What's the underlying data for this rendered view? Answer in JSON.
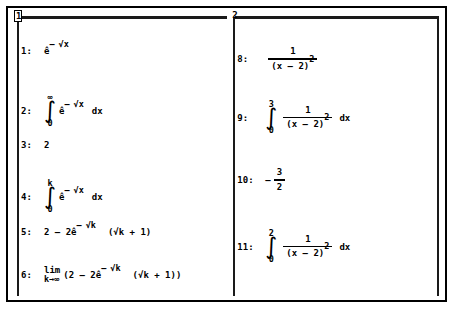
{
  "window": {
    "title": "Algebra Window",
    "pane_divider": "vertical"
  },
  "panes": [
    {
      "badge": "1",
      "name": "pane-one",
      "rows": [
        {
          "label": "1:",
          "kind": "power",
          "base": "ê",
          "exponent_sign": "–",
          "exponent": "√x"
        },
        {
          "label": "2:",
          "kind": "integral",
          "lower": "0",
          "upper": "∞",
          "base": "ê",
          "exponent_sign": "–",
          "exponent": "√x",
          "differential": "dx"
        },
        {
          "label": "3:",
          "kind": "plain",
          "text": "2"
        },
        {
          "label": "4:",
          "kind": "integral",
          "lower": "0",
          "upper": "k",
          "base": "ê",
          "exponent_sign": "–",
          "exponent": "√x",
          "differential": "dx"
        },
        {
          "label": "5:",
          "kind": "expr5",
          "prefix": "2  –  2 ",
          "base": "ê",
          "exponent_sign": "–",
          "exponent": "√k",
          "suffix": "(√k  +  1)"
        },
        {
          "label": "6:",
          "kind": "limit",
          "lim_main": "lim",
          "lim_sub": "k→∞",
          "prefix": "(2  –  2 ",
          "base": "ê",
          "exponent_sign": "–",
          "exponent": "√k",
          "suffix": "(√k  +  1))"
        },
        {
          "label": "7:",
          "kind": "cursor",
          "cursor_char": "2"
        }
      ]
    },
    {
      "badge": "2",
      "name": "pane-two",
      "rows": [
        {
          "label": "8:",
          "kind": "fraction",
          "numerator": "1",
          "denominator_base": "(x  –  2)",
          "denominator_exp": "2"
        },
        {
          "label": "9:",
          "kind": "int-frac",
          "lower": "0",
          "upper": "3",
          "numerator": "1",
          "denominator_base": "(x  –  2)",
          "denominator_exp": "2",
          "differential": "dx"
        },
        {
          "label": "10:",
          "kind": "neg-frac",
          "sign": "–",
          "numerator": "3",
          "denominator": "2"
        },
        {
          "label": "11:",
          "kind": "int-frac",
          "lower": "0",
          "upper": "2",
          "numerator": "1",
          "denominator_base": "(x  –  2)",
          "denominator_exp": "2",
          "differential": "dx"
        },
        {
          "label": "12:",
          "kind": "cursor-split",
          "cursor_char": ""
        }
      ]
    }
  ]
}
